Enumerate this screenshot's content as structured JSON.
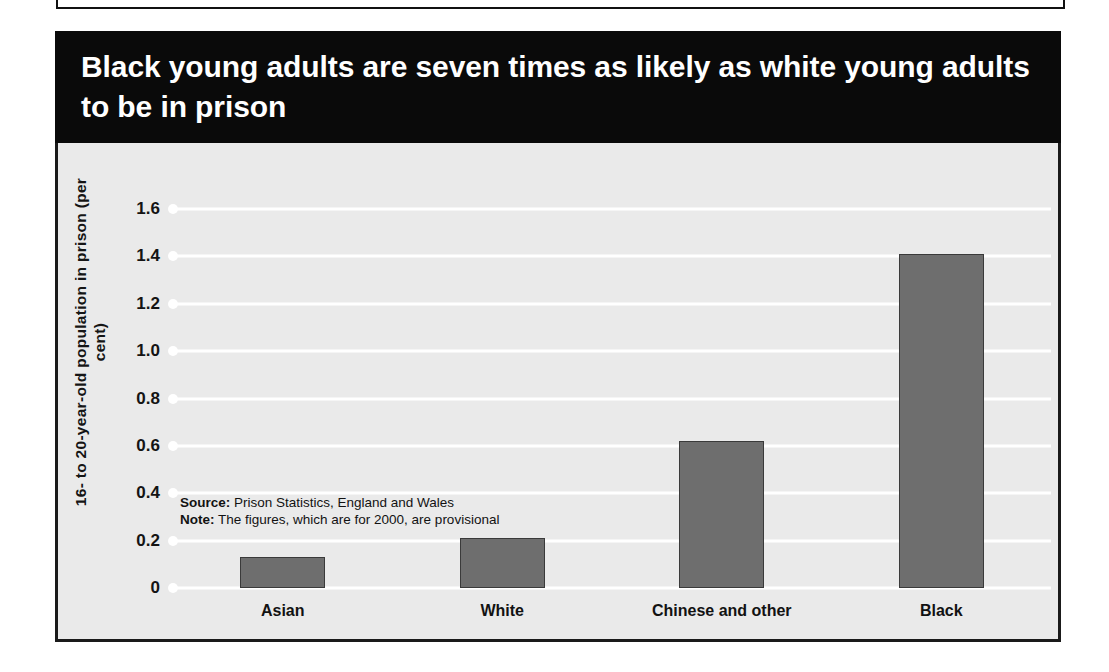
{
  "chart_data": {
    "type": "bar",
    "title": "Black young adults are seven times as likely as white young adults to be in prison",
    "categories": [
      "Asian",
      "White",
      "Chinese and other",
      "Black"
    ],
    "values": [
      0.13,
      0.21,
      0.62,
      1.41
    ],
    "xlabel": "",
    "ylabel": "16- to 20-year-old population in prison (per cent)",
    "ylim": [
      0,
      1.6
    ],
    "yticks": [
      "0",
      "0.2",
      "0.4",
      "0.6",
      "0.8",
      "1.0",
      "1.2",
      "1.4",
      "1.6"
    ],
    "ytick_values": [
      0,
      0.2,
      0.4,
      0.6,
      0.8,
      1.0,
      1.2,
      1.4,
      1.6
    ],
    "grid": true,
    "legend": "none",
    "bar_color": "#6e6e6e",
    "panel_color": "#eaeaea",
    "gridline_color": "#ffffff",
    "title_band_color": "#0a0a0a",
    "title_text_color": "#ffffff"
  },
  "footnote": {
    "source_label": "Source:",
    "source_text": " Prison Statistics, England and Wales",
    "note_label": "Note:",
    "note_text": " The figures, which are for 2000, are provisional"
  }
}
